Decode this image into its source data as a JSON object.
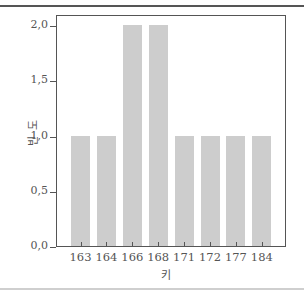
{
  "chart_data": {
    "type": "bar",
    "title": "",
    "xlabel": "키",
    "ylabel": "빈도",
    "categories": [
      "163",
      "164",
      "166",
      "168",
      "171",
      "172",
      "177",
      "184"
    ],
    "values": [
      1,
      1,
      2,
      2,
      1,
      1,
      1,
      1
    ],
    "ylim": [
      0,
      2.1
    ],
    "yticks": [
      "0,0",
      "0,5",
      "1,0",
      "1,5",
      "2,0"
    ],
    "grid": false,
    "legend": null,
    "bar_color": "#cdcdcd"
  }
}
